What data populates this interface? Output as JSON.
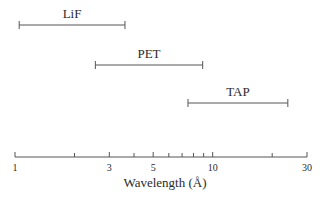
{
  "chart_data": {
    "type": "range-bar",
    "title": "",
    "xlabel": "Wavelength (Å)",
    "ylabel": "",
    "xscale": "log",
    "xlim": [
      1,
      30
    ],
    "x_ticks_major": [
      1,
      3,
      5,
      10,
      30
    ],
    "x_tick_labels": [
      "1",
      "3",
      "5",
      "10",
      "30"
    ],
    "x_ticks_minor": [
      2,
      4,
      6,
      7,
      8,
      9,
      20
    ],
    "grid": false,
    "legend": null,
    "series": [
      {
        "name": "LiF",
        "min": 1.05,
        "max": 3.6
      },
      {
        "name": "PET",
        "min": 2.55,
        "max": 8.9
      },
      {
        "name": "TAP",
        "min": 7.5,
        "max": 24
      }
    ]
  },
  "colors": {
    "line": "#555555",
    "text": "#2a2a2a"
  }
}
